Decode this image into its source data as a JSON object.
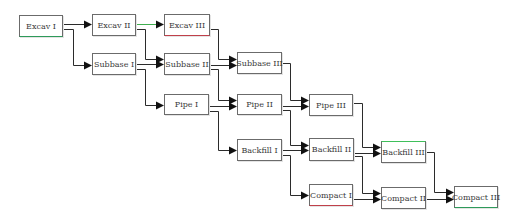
{
  "diagram": {
    "type": "precedence-network",
    "line_color": "#2b2b2b",
    "arrow_color": "#111111",
    "nodes": [
      {
        "id": "excav1",
        "label": "Excav I",
        "x": 19,
        "y": 15,
        "w": 44,
        "h": 22,
        "accent_bottom": "#2e9a5a"
      },
      {
        "id": "excav2",
        "label": "Excav II",
        "x": 92,
        "y": 14,
        "w": 44,
        "h": 22
      },
      {
        "id": "excav3",
        "label": "Excav III",
        "x": 164,
        "y": 14,
        "w": 46,
        "h": 22,
        "accent_bottom": "#c0404a"
      },
      {
        "id": "subbase1",
        "label": "Subbase I",
        "x": 92,
        "y": 53,
        "w": 44,
        "h": 22
      },
      {
        "id": "subbase2",
        "label": "Subbase II",
        "x": 164,
        "y": 53,
        "w": 46,
        "h": 22
      },
      {
        "id": "subbase3",
        "label": "Subbase III",
        "x": 237,
        "y": 52,
        "w": 45,
        "h": 22
      },
      {
        "id": "pipe1",
        "label": "Pipe I",
        "x": 164,
        "y": 94,
        "w": 45,
        "h": 21
      },
      {
        "id": "pipe2",
        "label": "Pipe II",
        "x": 237,
        "y": 94,
        "w": 45,
        "h": 21
      },
      {
        "id": "pipe3",
        "label": "Pipe III",
        "x": 309,
        "y": 94,
        "w": 44,
        "h": 22
      },
      {
        "id": "backfill1",
        "label": "Backfill I",
        "x": 237,
        "y": 139,
        "w": 45,
        "h": 22
      },
      {
        "id": "backfill2",
        "label": "Backfill II",
        "x": 309,
        "y": 138,
        "w": 45,
        "h": 23
      },
      {
        "id": "backfill3",
        "label": "Backfill III",
        "x": 381,
        "y": 141,
        "w": 45,
        "h": 22,
        "accent_top": "#3fbf5a"
      },
      {
        "id": "compact1",
        "label": "Compact I",
        "x": 309,
        "y": 184,
        "w": 44,
        "h": 22,
        "accent_bottom": "#c0404a"
      },
      {
        "id": "compact2",
        "label": "Compact II",
        "x": 381,
        "y": 187,
        "w": 45,
        "h": 22
      },
      {
        "id": "compact3",
        "label": "Compact III",
        "x": 454,
        "y": 186,
        "w": 44,
        "h": 22,
        "accent_bottom": "#2e9a5a"
      }
    ],
    "edges": [
      {
        "from": "excav1",
        "to": "excav2",
        "points": [
          [
            63,
            24
          ],
          [
            92,
            24
          ]
        ]
      },
      {
        "from": "excav1",
        "to": "subbase1",
        "points": [
          [
            63,
            29
          ],
          [
            73,
            29
          ],
          [
            73,
            65
          ],
          [
            92,
            65
          ]
        ]
      },
      {
        "from": "excav2",
        "to": "excav3",
        "points": [
          [
            136,
            24
          ],
          [
            164,
            24
          ]
        ],
        "color": "#3fae4f"
      },
      {
        "from": "excav2",
        "to": "subbase2",
        "points": [
          [
            136,
            29
          ],
          [
            145,
            29
          ],
          [
            145,
            59
          ],
          [
            164,
            59
          ]
        ]
      },
      {
        "from": "subbase1",
        "to": "subbase2",
        "points": [
          [
            136,
            64
          ],
          [
            164,
            64
          ]
        ]
      },
      {
        "from": "subbase1",
        "to": "pipe1",
        "points": [
          [
            136,
            69
          ],
          [
            145,
            69
          ],
          [
            145,
            105
          ],
          [
            164,
            105
          ]
        ]
      },
      {
        "from": "excav3",
        "to": "subbase3",
        "points": [
          [
            210,
            29
          ],
          [
            218,
            29
          ],
          [
            218,
            59
          ],
          [
            237,
            59
          ]
        ]
      },
      {
        "from": "subbase2",
        "to": "subbase3",
        "points": [
          [
            210,
            65
          ],
          [
            237,
            65
          ]
        ]
      },
      {
        "from": "subbase2",
        "to": "pipe2",
        "points": [
          [
            210,
            69
          ],
          [
            218,
            69
          ],
          [
            218,
            100
          ],
          [
            237,
            100
          ]
        ]
      },
      {
        "from": "pipe1",
        "to": "pipe2",
        "points": [
          [
            209,
            106
          ],
          [
            237,
            106
          ]
        ]
      },
      {
        "from": "pipe1",
        "to": "backfill1",
        "points": [
          [
            209,
            111
          ],
          [
            218,
            111
          ],
          [
            218,
            150
          ],
          [
            237,
            150
          ]
        ]
      },
      {
        "from": "subbase3",
        "to": "pipe3",
        "points": [
          [
            282,
            63
          ],
          [
            290,
            63
          ],
          [
            290,
            100
          ],
          [
            309,
            100
          ]
        ]
      },
      {
        "from": "pipe2",
        "to": "pipe3",
        "points": [
          [
            282,
            106
          ],
          [
            309,
            106
          ]
        ]
      },
      {
        "from": "pipe2",
        "to": "backfill2",
        "points": [
          [
            282,
            110
          ],
          [
            290,
            110
          ],
          [
            290,
            145
          ],
          [
            309,
            145
          ]
        ]
      },
      {
        "from": "backfill1",
        "to": "backfill2",
        "points": [
          [
            282,
            150
          ],
          [
            309,
            150
          ]
        ]
      },
      {
        "from": "backfill1",
        "to": "compact1",
        "points": [
          [
            282,
            155
          ],
          [
            290,
            155
          ],
          [
            290,
            195
          ],
          [
            309,
            195
          ]
        ]
      },
      {
        "from": "pipe3",
        "to": "backfill3",
        "points": [
          [
            353,
            103
          ],
          [
            362,
            103
          ],
          [
            362,
            147
          ],
          [
            381,
            147
          ]
        ]
      },
      {
        "from": "backfill2",
        "to": "backfill3",
        "points": [
          [
            354,
            153
          ],
          [
            381,
            153
          ]
        ]
      },
      {
        "from": "backfill2",
        "to": "compact2",
        "points": [
          [
            354,
            156
          ],
          [
            362,
            156
          ],
          [
            362,
            193
          ],
          [
            381,
            193
          ]
        ]
      },
      {
        "from": "compact1",
        "to": "compact2",
        "points": [
          [
            353,
            199
          ],
          [
            381,
            199
          ]
        ]
      },
      {
        "from": "backfill3",
        "to": "compact3",
        "points": [
          [
            426,
            152
          ],
          [
            434,
            152
          ],
          [
            434,
            192
          ],
          [
            454,
            192
          ]
        ]
      },
      {
        "from": "compact2",
        "to": "compact3",
        "points": [
          [
            426,
            199
          ],
          [
            454,
            199
          ]
        ]
      }
    ]
  }
}
